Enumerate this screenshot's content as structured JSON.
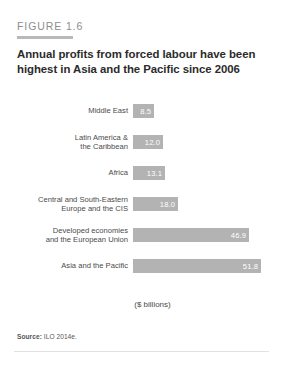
{
  "figure": {
    "eyebrow": "FIGURE 1.6",
    "title": "Annual profits from forced labour have been highest in Asia and the Pacific since 2006",
    "source_prefix": "Source:",
    "source_text": " ILO 2014e."
  },
  "colors": {
    "bar": "#b3b3b3",
    "accent_rule": "#b9b9b9",
    "title_text": "#2b2b2b",
    "eyebrow_text": "#8d8d8d",
    "value_text": "#ffffff"
  },
  "chart_data": {
    "type": "bar",
    "orientation": "horizontal",
    "title": "Annual profits from forced labour have been highest in Asia and the Pacific since 2006",
    "xlabel": "($ billions)",
    "ylabel": "",
    "grid": false,
    "legend": "none",
    "xlim": [
      0,
      55
    ],
    "categories": [
      "Middle East",
      "Latin America &\nthe Caribbean",
      "Africa",
      "Central and South-Eastern\nEurope and the CIS",
      "Developed economies\nand the European Union",
      "Asia and the Pacific"
    ],
    "values": [
      8.5,
      12.0,
      13.1,
      18.0,
      46.9,
      51.8
    ],
    "value_labels": [
      "8.5",
      "12.0",
      "13.1",
      "18.0",
      "46.9",
      "51.8"
    ],
    "bar_widths_px": [
      21,
      30,
      32,
      45,
      116,
      128
    ]
  }
}
